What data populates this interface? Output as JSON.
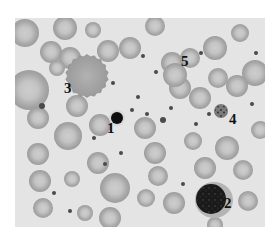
{
  "figure": {
    "background": "#e4e4e4",
    "labels": [
      {
        "text": "1",
        "x": 107,
        "y": 121
      },
      {
        "text": "2",
        "x": 224,
        "y": 196
      },
      {
        "text": "3",
        "x": 64,
        "y": 81
      },
      {
        "text": "4",
        "x": 229,
        "y": 112
      },
      {
        "text": "5",
        "x": 181,
        "y": 54
      }
    ],
    "labeled_cells": [
      {
        "id": "1",
        "type": "small-dark-nucleated",
        "cx": 102,
        "cy": 100,
        "r": 6,
        "color": "#0e0e0e"
      },
      {
        "id": "2",
        "type": "large-nucleated",
        "cx": 196,
        "cy": 181,
        "r": 15,
        "color": "#1a1a1a",
        "cytoplasm_color": "#b4b4b4"
      },
      {
        "id": "3",
        "type": "crenated-cell",
        "cx": 72,
        "cy": 58,
        "r": 20,
        "color": "#a2a2a2"
      },
      {
        "id": "4",
        "type": "small-granular",
        "cx": 206,
        "cy": 93,
        "r": 7,
        "color": "#555555"
      },
      {
        "id": "5",
        "type": "red-blood-cell",
        "cx": 160,
        "cy": 57,
        "r": 12,
        "color": "#a9a9a9"
      }
    ],
    "rbc_color": "#a8a8a8",
    "rbc_center_color": "#cdcdcd",
    "rbcs": [
      {
        "cx": 10,
        "cy": 15,
        "r": 14
      },
      {
        "cx": 50,
        "cy": 10,
        "r": 12
      },
      {
        "cx": 78,
        "cy": 12,
        "r": 8
      },
      {
        "cx": 36,
        "cy": 34,
        "r": 11
      },
      {
        "cx": 55,
        "cy": 40,
        "r": 11
      },
      {
        "cx": 93,
        "cy": 33,
        "r": 11
      },
      {
        "cx": 115,
        "cy": 30,
        "r": 11
      },
      {
        "cx": 14,
        "cy": 72,
        "r": 20
      },
      {
        "cx": 42,
        "cy": 50,
        "r": 8
      },
      {
        "cx": 23,
        "cy": 100,
        "r": 11
      },
      {
        "cx": 62,
        "cy": 88,
        "r": 11
      },
      {
        "cx": 85,
        "cy": 107,
        "r": 11
      },
      {
        "cx": 53,
        "cy": 118,
        "r": 14
      },
      {
        "cx": 23,
        "cy": 136,
        "r": 11
      },
      {
        "cx": 83,
        "cy": 145,
        "r": 11
      },
      {
        "cx": 57,
        "cy": 161,
        "r": 8
      },
      {
        "cx": 25,
        "cy": 163,
        "r": 11
      },
      {
        "cx": 100,
        "cy": 170,
        "r": 15
      },
      {
        "cx": 28,
        "cy": 190,
        "r": 10
      },
      {
        "cx": 70,
        "cy": 195,
        "r": 8
      },
      {
        "cx": 95,
        "cy": 200,
        "r": 11
      },
      {
        "cx": 130,
        "cy": 110,
        "r": 11
      },
      {
        "cx": 140,
        "cy": 135,
        "r": 11
      },
      {
        "cx": 131,
        "cy": 180,
        "r": 9
      },
      {
        "cx": 159,
        "cy": 185,
        "r": 11
      },
      {
        "cx": 143,
        "cy": 158,
        "r": 10
      },
      {
        "cx": 157,
        "cy": 45,
        "r": 11
      },
      {
        "cx": 165,
        "cy": 70,
        "r": 11
      },
      {
        "cx": 200,
        "cy": 30,
        "r": 12
      },
      {
        "cx": 225,
        "cy": 15,
        "r": 9
      },
      {
        "cx": 203,
        "cy": 60,
        "r": 10
      },
      {
        "cx": 240,
        "cy": 55,
        "r": 13
      },
      {
        "cx": 185,
        "cy": 80,
        "r": 11
      },
      {
        "cx": 222,
        "cy": 68,
        "r": 11
      },
      {
        "cx": 212,
        "cy": 130,
        "r": 12
      },
      {
        "cx": 178,
        "cy": 123,
        "r": 9
      },
      {
        "cx": 190,
        "cy": 150,
        "r": 11
      },
      {
        "cx": 228,
        "cy": 152,
        "r": 10
      },
      {
        "cx": 233,
        "cy": 183,
        "r": 10
      },
      {
        "cx": 245,
        "cy": 112,
        "r": 9
      },
      {
        "cx": 200,
        "cy": 207,
        "r": 8
      },
      {
        "cx": 140,
        "cy": 8,
        "r": 10
      },
      {
        "cx": 175,
        "cy": 40,
        "r": 10
      }
    ],
    "platelets": [
      {
        "cx": 128,
        "cy": 38,
        "r": 2
      },
      {
        "cx": 141,
        "cy": 54,
        "r": 2
      },
      {
        "cx": 186,
        "cy": 35,
        "r": 2
      },
      {
        "cx": 98,
        "cy": 65,
        "r": 2
      },
      {
        "cx": 123,
        "cy": 79,
        "r": 2
      },
      {
        "cx": 27,
        "cy": 88,
        "r": 3
      },
      {
        "cx": 117,
        "cy": 92,
        "r": 2
      },
      {
        "cx": 132,
        "cy": 96,
        "r": 2
      },
      {
        "cx": 156,
        "cy": 90,
        "r": 2
      },
      {
        "cx": 148,
        "cy": 102,
        "r": 3
      },
      {
        "cx": 181,
        "cy": 106,
        "r": 2
      },
      {
        "cx": 79,
        "cy": 120,
        "r": 2
      },
      {
        "cx": 90,
        "cy": 146,
        "r": 2
      },
      {
        "cx": 106,
        "cy": 135,
        "r": 2
      },
      {
        "cx": 39,
        "cy": 175,
        "r": 2
      },
      {
        "cx": 55,
        "cy": 193,
        "r": 2
      },
      {
        "cx": 168,
        "cy": 166,
        "r": 2
      },
      {
        "cx": 194,
        "cy": 96,
        "r": 2
      },
      {
        "cx": 237,
        "cy": 86,
        "r": 2
      },
      {
        "cx": 241,
        "cy": 35,
        "r": 2
      }
    ]
  }
}
